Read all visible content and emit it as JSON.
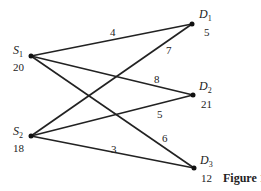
{
  "diagram": {
    "type": "bipartite-transportation-network",
    "sources": [
      {
        "id": "S1",
        "letter": "S",
        "sub": "1",
        "supply": "20",
        "x": 31,
        "y": 56
      },
      {
        "id": "S2",
        "letter": "S",
        "sub": "2",
        "supply": "18",
        "x": 31,
        "y": 136
      }
    ],
    "destinations": [
      {
        "id": "D1",
        "letter": "D",
        "sub": "1",
        "demand": "5",
        "x": 192,
        "y": 24
      },
      {
        "id": "D2",
        "letter": "D",
        "sub": "2",
        "demand": "21",
        "x": 193,
        "y": 95
      },
      {
        "id": "D3",
        "letter": "D",
        "sub": "3",
        "demand": "12",
        "x": 194,
        "y": 168
      }
    ],
    "edges": [
      {
        "from": "S1",
        "to": "D1",
        "cost": "4"
      },
      {
        "from": "S1",
        "to": "D2",
        "cost": "8"
      },
      {
        "from": "S1",
        "to": "D3",
        "cost": "6"
      },
      {
        "from": "S2",
        "to": "D1",
        "cost": "7"
      },
      {
        "from": "S2",
        "to": "D2",
        "cost": "5"
      },
      {
        "from": "S2",
        "to": "D3",
        "cost": "3"
      }
    ],
    "caption": "Figure 1",
    "colors": {
      "line": "#222222",
      "node": "#111111",
      "background": "#ffffff"
    }
  }
}
